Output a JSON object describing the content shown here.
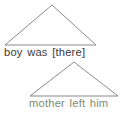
{
  "figure": {
    "background_color": "#ffffff",
    "width": 123,
    "height": 116
  },
  "constituents": [
    {
      "id": "upper",
      "text": "boy was [there]",
      "text_color": "#3a3a3a",
      "triangle": {
        "apex_x": 52,
        "apex_y": 5,
        "left_x": 5,
        "right_x": 96,
        "base_y": 45,
        "stroke_color": "#8a8a8a",
        "stroke_width": 1
      }
    },
    {
      "id": "lower",
      "text": "mother left him",
      "text_color": "#7c8c74",
      "triangle": {
        "apex_x": 74,
        "apex_y": 62,
        "left_x": 30,
        "right_x": 118,
        "base_y": 96,
        "stroke_color": "#8a8a8a",
        "stroke_width": 1
      }
    }
  ]
}
